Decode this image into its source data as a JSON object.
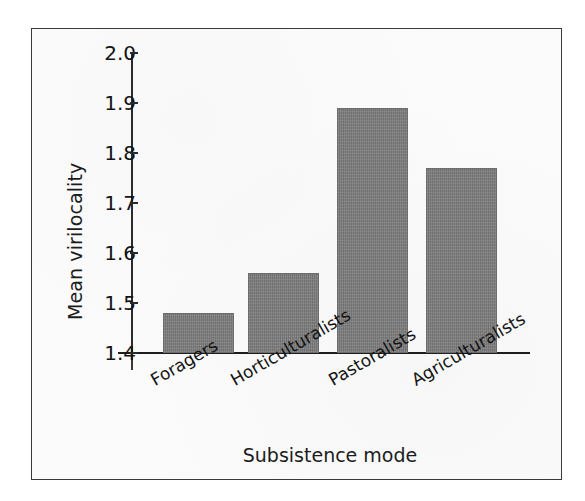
{
  "figure": {
    "frame_color": "#3a3a3a",
    "background_color": "#fbfbfc"
  },
  "chart_data": {
    "type": "bar",
    "title": "",
    "subtitle": "",
    "xlabel": "Subsistence mode",
    "ylabel": "Mean virilocality",
    "categories": [
      "Foragers",
      "Horticulturalists",
      "Pastoralists",
      "Agriculturalists"
    ],
    "values": [
      1.48,
      1.56,
      1.89,
      1.77
    ],
    "series": [
      {
        "name": "Mean virilocality",
        "values": [
          1.48,
          1.56,
          1.89,
          1.77
        ]
      }
    ],
    "ylim": [
      1.4,
      2.0
    ],
    "ytick_labels": [
      "2.0",
      "1.9",
      "1.8",
      "1.7",
      "1.6",
      "1.5",
      "1.4"
    ],
    "ytick_values": [
      2.0,
      1.9,
      1.8,
      1.7,
      1.6,
      1.5,
      1.4
    ],
    "grid": false,
    "legend": false,
    "legend_position": "none",
    "bar_color": "#7b7b7b",
    "axis_color": "#1e1e1e",
    "category_label_rotation_deg": -30
  }
}
